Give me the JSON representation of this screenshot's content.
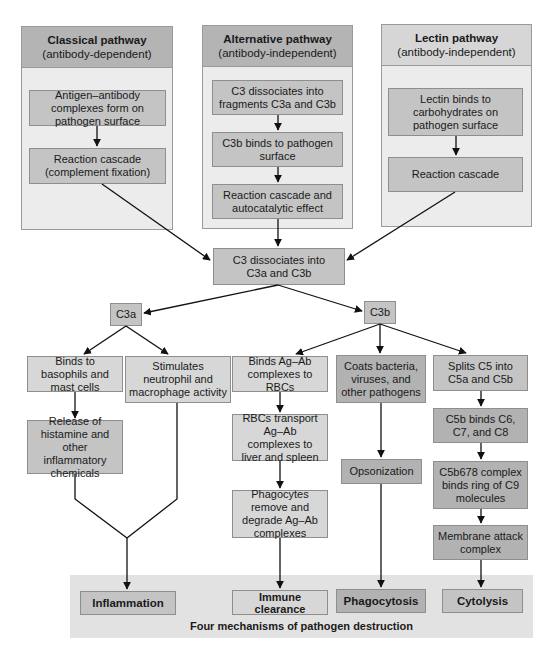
{
  "pathways": [
    {
      "title": "Classical pathway",
      "subtitle": "(antibody-dependent)",
      "steps": [
        "Antigen–antibody complexes form on pathogen surface",
        "Reaction cascade (complement fixation)"
      ]
    },
    {
      "title": "Alternative pathway",
      "subtitle": "(antibody-independent)",
      "steps": [
        "C3 dissociates into fragments C3a and C3b",
        "C3b binds to pathogen surface",
        "Reaction cascade and autocatalytic effect"
      ]
    },
    {
      "title": "Lectin pathway",
      "subtitle": "(antibody-independent)",
      "steps": [
        "Lectin binds to carbohydrates on pathogen surface",
        "Reaction cascade"
      ]
    }
  ],
  "central": {
    "label": "C3 dissociates into C3a and C3b"
  },
  "fragments": {
    "c3a": "C3a",
    "c3b": "C3b"
  },
  "c3a_branch": {
    "basophils": "Binds to basophils and mast cells",
    "histamine": "Release of histamine and other inflammatory chemicals",
    "stimulates": "Stimulates neutrophil and macrophage activity"
  },
  "c3b_branch": {
    "binds_rbc": "Binds Ag–Ab complexes to RBCs",
    "rbc_transport": "RBCs transport Ag–Ab complexes to liver and spleen",
    "phagocytes_remove": "Phagocytes remove and degrade Ag–Ab complexes",
    "coats": "Coats bacteria, viruses, and other pathogens",
    "opsonization": "Opsonization",
    "splits_c5": "Splits C5 into C5a and C5b",
    "c5b_binds": "C5b binds C6, C7, and C8",
    "c5b678": "C5b678 complex binds ring of C9 molecules",
    "mac": "Membrane attack complex"
  },
  "outcomes": {
    "items": [
      "Inflammation",
      "Immune clearance",
      "Phagocytosis",
      "Cytolysis"
    ],
    "caption": "Four mechanisms of pathogen destruction"
  },
  "colors": {
    "panel_bg": "#ececec",
    "box_mid": "#c4c4c4",
    "box_light": "#d7d7d7",
    "box_dark": "#b2b2b2",
    "band": "#e2e2e2",
    "line": "#111111"
  }
}
